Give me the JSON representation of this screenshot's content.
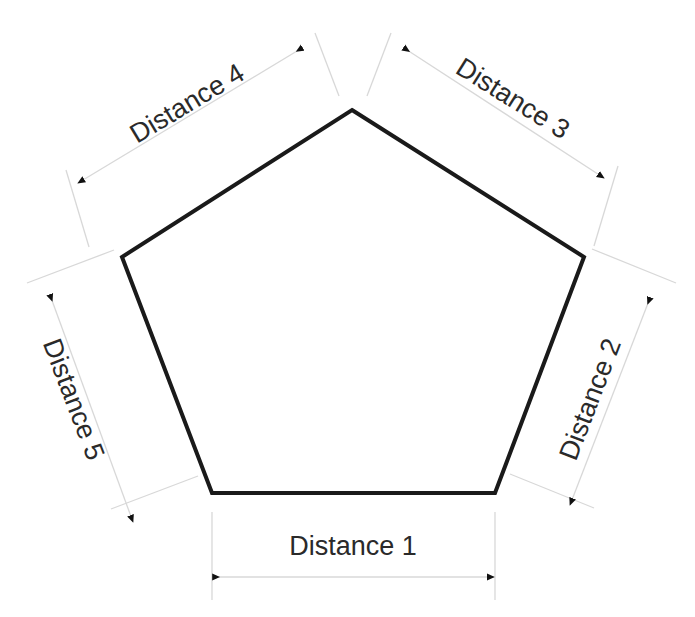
{
  "diagram": {
    "type": "geometry-dimension-diagram",
    "shape_name": "pentagon",
    "background_color": "#ffffff",
    "shape": {
      "stroke_color": "#1a1a1a",
      "stroke_width": 4,
      "fill": "none",
      "sides": 5,
      "vertices": [
        {
          "name": "apex",
          "x": 352,
          "y": 110
        },
        {
          "name": "right-shoulder",
          "x": 584,
          "y": 257
        },
        {
          "name": "bottom-right",
          "x": 495,
          "y": 493
        },
        {
          "name": "bottom-left",
          "x": 212,
          "y": 493
        },
        {
          "name": "left-shoulder",
          "x": 122,
          "y": 257
        }
      ]
    },
    "dimension_style": {
      "line_color": "#d8d8d8",
      "line_width": 1.3,
      "arrow_color": "#111111",
      "text_color": "#2a2a2a",
      "text_size": 27
    },
    "dimensions": [
      {
        "id": "distance-1",
        "label": "Distance 1",
        "edge": "bottom",
        "arrow_start": {
          "x": 213,
          "y": 577
        },
        "arrow_end": {
          "x": 494,
          "y": 577
        },
        "extension_lines": [
          {
            "x1": 212,
            "y1": 512,
            "x2": 212,
            "y2": 600
          },
          {
            "x1": 495,
            "y1": 512,
            "x2": 495,
            "y2": 600
          }
        ],
        "label_position": {
          "x": 353,
          "y": 548
        },
        "label_rotation": 0
      },
      {
        "id": "distance-2",
        "label": "Distance 2",
        "edge": "lower-right",
        "arrow_start": {
          "x": 650,
          "y": 298
        },
        "arrow_end": {
          "x": 570,
          "y": 505
        },
        "extension_lines": [
          {
            "x1": 592,
            "y1": 249,
            "x2": 676,
            "y2": 283
          },
          {
            "x1": 510,
            "y1": 474,
            "x2": 594,
            "y2": 508
          }
        ],
        "label_position": {
          "x": 592,
          "y": 400
        },
        "label_rotation": -69
      },
      {
        "id": "distance-3",
        "label": "Distance 3",
        "edge": "upper-right",
        "arrow_start": {
          "x": 404,
          "y": 48
        },
        "arrow_end": {
          "x": 604,
          "y": 178
        },
        "extension_lines": [
          {
            "x1": 367,
            "y1": 96,
            "x2": 391,
            "y2": 33
          },
          {
            "x1": 594,
            "y1": 246,
            "x2": 618,
            "y2": 166
          }
        ],
        "label_position": {
          "x": 512,
          "y": 100
        },
        "label_rotation": 32
      },
      {
        "id": "distance-4",
        "label": "Distance 4",
        "edge": "upper-left",
        "arrow_start": {
          "x": 302,
          "y": 48
        },
        "arrow_end": {
          "x": 78,
          "y": 183
        },
        "extension_lines": [
          {
            "x1": 339,
            "y1": 96,
            "x2": 315,
            "y2": 33
          },
          {
            "x1": 89,
            "y1": 247,
            "x2": 66,
            "y2": 170
          }
        ],
        "label_position": {
          "x": 188,
          "y": 105
        },
        "label_rotation": -31
      },
      {
        "id": "distance-5",
        "label": "Distance 5",
        "edge": "lower-left",
        "arrow_start": {
          "x": 50,
          "y": 295
        },
        "arrow_end": {
          "x": 133,
          "y": 522
        },
        "extension_lines": [
          {
            "x1": 114,
            "y1": 250,
            "x2": 27,
            "y2": 283
          },
          {
            "x1": 198,
            "y1": 476,
            "x2": 111,
            "y2": 509
          }
        ],
        "label_position": {
          "x": 72,
          "y": 400
        },
        "label_rotation": 69
      }
    ]
  }
}
